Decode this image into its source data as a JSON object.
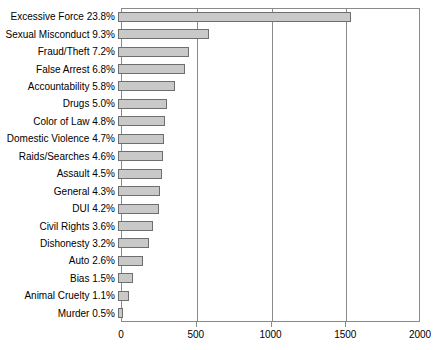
{
  "chart_data": {
    "type": "bar",
    "orientation": "horizontal",
    "title": "",
    "xlabel": "",
    "ylabel": "",
    "xlim": [
      0,
      2000
    ],
    "xticks": [
      0,
      500,
      1000,
      1500,
      2000
    ],
    "xtick_labels": [
      "0",
      "500",
      "1000",
      "1500",
      "2000"
    ],
    "grid": true,
    "legend": false,
    "bar_fill_color": "#c9c9c9",
    "bar_border_color": "#6e6e6e",
    "axis_color": "#8a8a8a",
    "categories": [
      "Excessive Force",
      "Sexual Misconduct",
      "Fraud/Theft",
      "False Arrest",
      "Accountability",
      "Drugs",
      "Color of Law",
      "Domestic Violence",
      "Raids/Searches",
      "Assault",
      "General",
      "DUI",
      "Civil Rights",
      "Dishonesty",
      "Auto",
      "Bias",
      "Animal Cruelty",
      "Murder"
    ],
    "percentages": [
      23.8,
      9.3,
      7.2,
      6.8,
      5.8,
      5.0,
      4.8,
      4.7,
      4.6,
      4.5,
      4.3,
      4.2,
      3.6,
      3.2,
      2.6,
      1.5,
      1.1,
      0.5
    ],
    "values": [
      1560,
      610,
      472,
      446,
      380,
      328,
      315,
      308,
      302,
      295,
      282,
      275,
      236,
      210,
      170,
      98,
      72,
      33
    ],
    "tick_labels_y": [
      "Excessive Force 23.8%",
      "Sexual Misconduct 9.3%",
      "Fraud/Theft 7.2%",
      "False Arrest 6.8%",
      "Accountability 5.8%",
      "Drugs 5.0%",
      "Color of Law 4.8%",
      "Domestic Violence 4.7%",
      "Raids/Searches 4.6%",
      "Assault 4.5%",
      "General 4.3%",
      "DUI 4.2%",
      "Civil Rights 3.6%",
      "Dishonesty 3.2%",
      "Auto 2.6%",
      "Bias 1.5%",
      "Animal Cruelty 1.1%",
      "Murder 0.5%"
    ]
  }
}
